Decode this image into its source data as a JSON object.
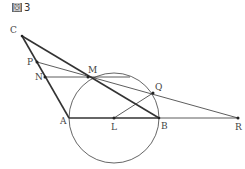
{
  "figure": {
    "title_kanji": "図",
    "title_number": "3"
  },
  "points": {
    "C": {
      "label": "C",
      "x": 22,
      "y": 36
    },
    "P": {
      "label": "P",
      "x": 37,
      "y": 62
    },
    "N": {
      "label": "N",
      "x": 45,
      "y": 77
    },
    "M": {
      "label": "M",
      "x": 88,
      "y": 77
    },
    "Q": {
      "label": "Q",
      "x": 153,
      "y": 93
    },
    "A": {
      "label": "A",
      "x": 69,
      "y": 118
    },
    "L": {
      "label": "L",
      "x": 114,
      "y": 118
    },
    "B": {
      "label": "B",
      "x": 159,
      "y": 118
    },
    "R": {
      "label": "R",
      "x": 238,
      "y": 118
    }
  },
  "circle": {
    "center": "L",
    "radius": 45
  },
  "colors": {
    "line": "#333333",
    "circle": "#555555"
  }
}
